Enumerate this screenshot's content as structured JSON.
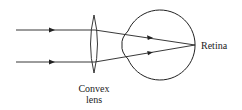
{
  "diagram": {
    "type": "optics-ray-diagram",
    "labels": {
      "lens_line1": "Convex",
      "lens_line2": "lens",
      "retina": "Retina"
    },
    "colors": {
      "stroke": "#222222",
      "background": "#ffffff"
    },
    "elements": [
      {
        "id": "ray-top",
        "kind": "incident-ray",
        "from": [
          16,
          30
        ],
        "to": [
          95,
          30
        ],
        "arrow_at": 52
      },
      {
        "id": "ray-bottom",
        "kind": "incident-ray",
        "from": [
          16,
          62
        ],
        "to": [
          95,
          62
        ],
        "arrow_at": 52
      },
      {
        "id": "convex-lens",
        "kind": "lens",
        "center": [
          94,
          44
        ],
        "height": 58,
        "width": 8
      },
      {
        "id": "eyeball",
        "kind": "eye",
        "center": [
          160,
          45
        ],
        "radius": 35
      },
      {
        "id": "focus-point",
        "kind": "retina-focus",
        "point": [
          195,
          45
        ]
      }
    ]
  }
}
